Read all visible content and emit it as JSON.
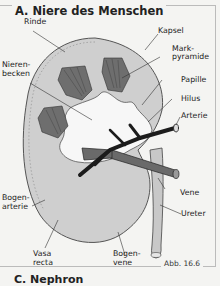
{
  "figure": {
    "title": "A. Niere des Menschen",
    "caption": "Abb. 16.6",
    "next_section_title": "C. Nephron"
  },
  "labels": {
    "rinde": "Rinde",
    "kapsel": "Kapsel",
    "markpyramide_1": "Mark-",
    "markpyramide_2": "pyramide",
    "nierenbecken_1": "Nieren-",
    "nierenbecken_2": "becken",
    "papille": "Papille",
    "hilus": "Hilus",
    "arterie": "Arterie",
    "vene": "Vene",
    "ureter": "Ureter",
    "bogenarterie_1": "Bogen-",
    "bogenarterie_2": "arterie",
    "vasa_recta_1": "Vasa",
    "vasa_recta_2": "recta",
    "bogenvene_1": "Bogen-",
    "bogenvene_2": "vene"
  },
  "colors": {
    "cortex": "#cfcfcf",
    "pyramid": "#6e6e6e",
    "pelvis": "#f7f7f7",
    "artery": "#1c1c1c",
    "vein": "#6a6a6a",
    "ureter": "#c8c8c8",
    "background": "#f4f4f2"
  }
}
